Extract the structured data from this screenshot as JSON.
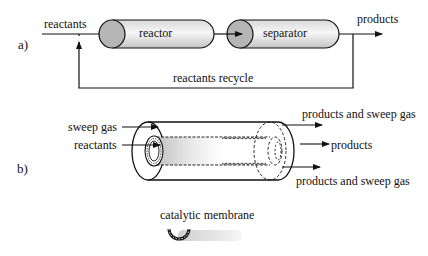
{
  "panel_a": {
    "label": "a)",
    "inlet_label": "reactants",
    "reactor_label": "reactor",
    "separator_label": "separator",
    "outlet_label": "products",
    "recycle_label": "reactants recycle"
  },
  "panel_b": {
    "label": "b)",
    "sweep_gas_label": "sweep gas",
    "reactants_label": "reactants",
    "top_outlet_label": "products and sweep gas",
    "center_outlet_label": "products",
    "bottom_outlet_label": "products and sweep gas"
  },
  "legend": {
    "label": "catalytic membrane"
  },
  "colors": {
    "line": "#111111",
    "cap_fill": "#b8b8b8",
    "tube_light": "#f4f4f4",
    "tube_dark": "#c9c9c9"
  }
}
